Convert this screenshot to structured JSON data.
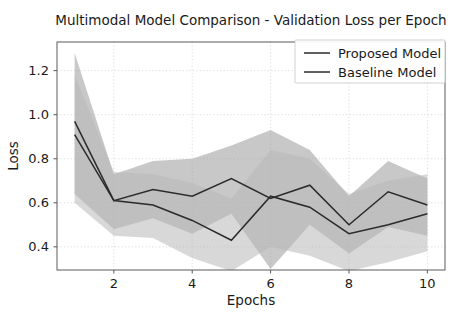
{
  "figure": {
    "width": 466,
    "height": 322,
    "background": "#ffffff"
  },
  "plot_area": {
    "left": 57,
    "top": 42,
    "right": 445,
    "bottom": 270
  },
  "style": {
    "line_color": "#2b2b2b",
    "band_color_proposed": "#9a9a9a",
    "band_color_baseline": "#b8b8b8",
    "grid_color": "#d8d8d8",
    "axis_color": "#5a5a5a",
    "text_color": "#1a1a1a",
    "band_opacity": 0.55
  },
  "chart_data": {
    "type": "line",
    "title": "Multimodal Model Comparison - Validation Loss per Epoch",
    "xlabel": "Epochs",
    "ylabel": "Loss",
    "grid": true,
    "legend_position": "upper right",
    "x": [
      1,
      2,
      3,
      4,
      5,
      6,
      7,
      8,
      9,
      10
    ],
    "xlim": [
      0.55,
      10.45
    ],
    "ylim": [
      0.295,
      1.33
    ],
    "xticks": [
      2,
      4,
      6,
      8,
      10
    ],
    "xtick_labels": [
      "2",
      "4",
      "6",
      "8",
      "10"
    ],
    "yticks": [
      0.4,
      0.6,
      0.8,
      1.0,
      1.2
    ],
    "ytick_labels": [
      "0.4",
      "0.6",
      "0.8",
      "1.0",
      "1.2"
    ],
    "series": [
      {
        "name": "Proposed Model",
        "color": "#2b2b2b",
        "band_color": "#9a9a9a",
        "values": [
          0.97,
          0.61,
          0.66,
          0.63,
          0.71,
          0.62,
          0.68,
          0.5,
          0.65,
          0.59
        ],
        "band_upper": [
          1.28,
          0.73,
          0.79,
          0.8,
          0.86,
          0.93,
          0.84,
          0.63,
          0.79,
          0.71
        ],
        "band_lower": [
          0.64,
          0.48,
          0.53,
          0.46,
          0.55,
          0.3,
          0.5,
          0.37,
          0.49,
          0.45
        ]
      },
      {
        "name": "Baseline Model",
        "color": "#2b2b2b",
        "band_color": "#b8b8b8",
        "values": [
          0.91,
          0.61,
          0.59,
          0.52,
          0.43,
          0.63,
          0.58,
          0.46,
          0.5,
          0.55
        ],
        "band_upper": [
          1.18,
          0.74,
          0.73,
          0.69,
          0.62,
          0.84,
          0.8,
          0.64,
          0.7,
          0.73
        ],
        "band_lower": [
          0.6,
          0.45,
          0.44,
          0.35,
          0.29,
          0.4,
          0.36,
          0.29,
          0.33,
          0.38
        ]
      }
    ]
  },
  "legend": {
    "entries": [
      {
        "label": "Proposed Model"
      },
      {
        "label": "Baseline Model"
      }
    ]
  }
}
